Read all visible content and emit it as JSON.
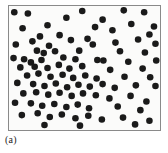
{
  "figure": {
    "caption": "(a)",
    "panel_label": "(a)",
    "background_color": "#ffffff",
    "plot_background_color": "#fbfbfa",
    "frame_color": "#8a8a8a",
    "marker_color": "#1a1a1a"
  },
  "chart_data": {
    "type": "scatter",
    "title": "",
    "subtitle": "",
    "xlabel": "",
    "ylabel": "",
    "xlim": [
      0,
      100
    ],
    "ylim": [
      0,
      100
    ],
    "grid": false,
    "legend": null,
    "annotations": [
      "(a)"
    ],
    "marker": {
      "shape": "circle",
      "color": "#1a1a1a",
      "size_px": 6.6,
      "filled": true
    },
    "pattern": "clustered",
    "n_points": 100,
    "series": [
      {
        "name": "points",
        "color": "#1a1a1a",
        "points": [
          [
            3.5,
            95.0
          ],
          [
            12.5,
            94.0
          ],
          [
            25.5,
            84.5
          ],
          [
            38.0,
            90.5
          ],
          [
            48.5,
            96.0
          ],
          [
            62.0,
            89.0
          ],
          [
            76.0,
            96.5
          ],
          [
            89.5,
            95.0
          ],
          [
            96.0,
            83.5
          ],
          [
            9.0,
            82.0
          ],
          [
            20.5,
            75.5
          ],
          [
            33.5,
            76.5
          ],
          [
            57.0,
            83.0
          ],
          [
            68.5,
            80.5
          ],
          [
            81.0,
            85.5
          ],
          [
            93.0,
            77.0
          ],
          [
            4.5,
            69.0
          ],
          [
            15.5,
            71.5
          ],
          [
            26.5,
            68.0
          ],
          [
            41.0,
            72.5
          ],
          [
            52.0,
            73.5
          ],
          [
            55.5,
            69.0
          ],
          [
            70.5,
            70.5
          ],
          [
            85.5,
            73.0
          ],
          [
            97.0,
            69.5
          ],
          [
            18.5,
            64.0
          ],
          [
            23.0,
            62.0
          ],
          [
            30.5,
            63.5
          ],
          [
            46.5,
            64.0
          ],
          [
            73.5,
            63.5
          ],
          [
            90.0,
            62.5
          ],
          [
            3.0,
            58.0
          ],
          [
            10.0,
            57.0
          ],
          [
            14.5,
            54.5
          ],
          [
            21.5,
            56.5
          ],
          [
            36.0,
            58.5
          ],
          [
            44.0,
            57.0
          ],
          [
            58.5,
            56.5
          ],
          [
            62.5,
            56.0
          ],
          [
            79.0,
            55.0
          ],
          [
            97.5,
            56.0
          ],
          [
            7.5,
            50.5
          ],
          [
            17.0,
            51.0
          ],
          [
            25.5,
            50.0
          ],
          [
            33.0,
            52.5
          ],
          [
            40.0,
            49.5
          ],
          [
            48.5,
            51.5
          ],
          [
            67.0,
            48.5
          ],
          [
            88.5,
            49.5
          ],
          [
            12.0,
            44.0
          ],
          [
            19.5,
            45.5
          ],
          [
            27.5,
            43.0
          ],
          [
            35.5,
            44.5
          ],
          [
            42.5,
            42.0
          ],
          [
            50.5,
            44.0
          ],
          [
            58.0,
            41.5
          ],
          [
            76.5,
            43.0
          ],
          [
            93.5,
            42.5
          ],
          [
            5.5,
            38.0
          ],
          [
            16.0,
            37.0
          ],
          [
            23.5,
            35.5
          ],
          [
            31.0,
            37.5
          ],
          [
            38.5,
            34.5
          ],
          [
            46.0,
            36.5
          ],
          [
            53.5,
            35.0
          ],
          [
            62.0,
            37.0
          ],
          [
            70.0,
            34.0
          ],
          [
            84.0,
            36.0
          ],
          [
            97.0,
            35.5
          ],
          [
            9.5,
            29.5
          ],
          [
            18.0,
            30.5
          ],
          [
            26.0,
            28.5
          ],
          [
            33.5,
            30.0
          ],
          [
            41.5,
            27.5
          ],
          [
            49.0,
            29.5
          ],
          [
            57.5,
            28.0
          ],
          [
            66.5,
            25.5
          ],
          [
            80.5,
            27.5
          ],
          [
            91.0,
            23.0
          ],
          [
            4.0,
            22.0
          ],
          [
            14.5,
            21.5
          ],
          [
            22.0,
            19.5
          ],
          [
            30.0,
            21.0
          ],
          [
            38.0,
            18.5
          ],
          [
            45.5,
            20.5
          ],
          [
            53.0,
            17.5
          ],
          [
            72.0,
            19.0
          ],
          [
            87.0,
            16.0
          ],
          [
            8.5,
            12.0
          ],
          [
            19.0,
            13.5
          ],
          [
            27.0,
            10.5
          ],
          [
            35.0,
            12.5
          ],
          [
            44.0,
            9.5
          ],
          [
            52.5,
            11.5
          ],
          [
            61.5,
            8.5
          ],
          [
            75.5,
            10.0
          ],
          [
            93.0,
            7.5
          ],
          [
            23.5,
            4.0
          ],
          [
            47.0,
            3.5
          ],
          [
            83.5,
            4.5
          ]
        ]
      }
    ]
  }
}
